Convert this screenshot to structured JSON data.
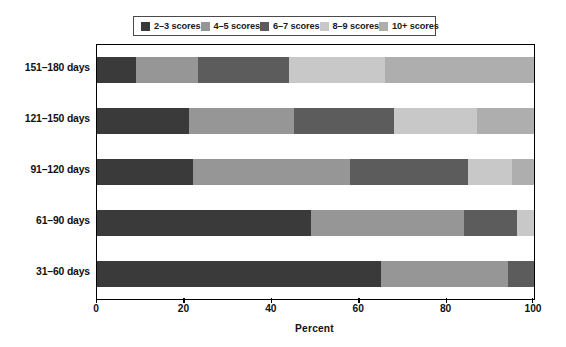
{
  "chart_data": {
    "type": "bar",
    "orientation": "horizontal",
    "stacked": true,
    "stacked_normalized": true,
    "title": "",
    "xlabel": "Percent",
    "ylabel": "",
    "xlim": [
      0,
      100
    ],
    "xticks": [
      0,
      20,
      40,
      60,
      80,
      100
    ],
    "xtick_labels": [
      "0",
      "20",
      "40",
      "60",
      "80",
      "100"
    ],
    "grid": false,
    "legend_position": "top-center",
    "categories": [
      "151–180 days",
      "121–150 days",
      "91–120 days",
      "61–90 days",
      "31–60 days"
    ],
    "series": [
      {
        "name": "2–3 scores",
        "color": "#3a3a3a",
        "values": [
          9,
          21,
          22,
          49,
          65
        ]
      },
      {
        "name": "4–5 scores",
        "color": "#969696",
        "values": [
          14,
          24,
          36,
          35,
          29
        ]
      },
      {
        "name": "6–7 scores",
        "color": "#5c5c5c",
        "values": [
          21,
          23,
          27,
          12,
          6
        ]
      },
      {
        "name": "8–9 scores",
        "color": "#c8c8c8",
        "values": [
          22,
          19,
          10,
          4,
          0
        ]
      },
      {
        "name": "10+ scores",
        "color": "#aeaeae",
        "values": [
          34,
          13,
          5,
          0,
          0
        ]
      }
    ]
  },
  "legend": {
    "items": [
      {
        "label": "2–3 scores",
        "swatch": "#3a3a3a"
      },
      {
        "label": "4–5 scores",
        "swatch": "#969696"
      },
      {
        "label": "6–7 scores",
        "swatch": "#5c5c5c"
      },
      {
        "label": "8–9 scores",
        "swatch": "#c8c8c8"
      },
      {
        "label": "10+ scores",
        "swatch": "#aeaeae"
      }
    ]
  },
  "axis": {
    "x_title": "Percent",
    "x_tick_labels": [
      "0",
      "20",
      "40",
      "60",
      "80",
      "100"
    ],
    "y_tick_labels": [
      "151–180 days",
      "121–150 days",
      "91–120 days",
      "61–90 days",
      "31–60 days"
    ]
  },
  "colors": {
    "frame": "#000000",
    "legend_border": "#4a4a4a",
    "text": "#111111",
    "background": "#ffffff"
  }
}
